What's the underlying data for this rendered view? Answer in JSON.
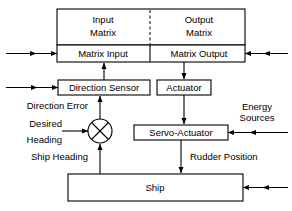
{
  "diagram": {
    "blocks": [
      {
        "id": "input_matrix",
        "label_line1": "Input",
        "label_line2": "Matrix"
      },
      {
        "id": "output_matrix",
        "label_line1": "Output",
        "label_line2": "Matrix"
      },
      {
        "id": "matrix_input",
        "label": "Matrix Input"
      },
      {
        "id": "matrix_output",
        "label": "Matrix Output"
      },
      {
        "id": "direction_sensor",
        "label": "Direction Sensor"
      },
      {
        "id": "actuator",
        "label": "Actuator"
      },
      {
        "id": "servo_actuator",
        "label": "Servo-Actuator"
      },
      {
        "id": "ship",
        "label": "Ship"
      }
    ],
    "signal_labels": [
      {
        "id": "direction_error",
        "text": "Direction Error"
      },
      {
        "id": "desired",
        "text": "Desired"
      },
      {
        "id": "heading",
        "text": "Heading"
      },
      {
        "id": "ship_heading",
        "text": "Ship Heading"
      },
      {
        "id": "energy",
        "text": "Energy"
      },
      {
        "id": "sources",
        "text": "Sources"
      },
      {
        "id": "rudder_position",
        "text": "Rudder Position"
      }
    ],
    "colors": {
      "stroke": "#000000",
      "fill": "#ffffff",
      "text": "#000000"
    }
  }
}
